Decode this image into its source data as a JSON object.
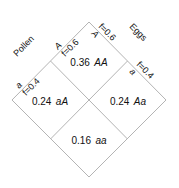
{
  "diagram": {
    "type": "punnett-square-diamond",
    "title": "",
    "line_color": "#b4b4b4",
    "text_color": "#111111",
    "axes": [
      {
        "name": "pollen",
        "label": "Pollen",
        "side": "left",
        "alleles": [
          {
            "allele": "A",
            "freq_label": "f=0.6",
            "freq": 0.6
          },
          {
            "allele": "a",
            "freq_label": "f=0.4",
            "freq": 0.4
          }
        ]
      },
      {
        "name": "eggs",
        "label": "Eggs",
        "side": "right",
        "alleles": [
          {
            "allele": "A",
            "freq_label": "f=0.6",
            "freq": 0.6
          },
          {
            "allele": "a",
            "freq_label": "f=0.4",
            "freq": 0.4
          }
        ]
      }
    ],
    "cells": [
      {
        "position": "top",
        "freq": "0.36",
        "genotype": "AA"
      },
      {
        "position": "left",
        "freq": "0.24",
        "genotype": "aA"
      },
      {
        "position": "right",
        "freq": "0.24",
        "genotype": "Aa"
      },
      {
        "position": "bottom",
        "freq": "0.16",
        "genotype": "aa"
      }
    ]
  }
}
